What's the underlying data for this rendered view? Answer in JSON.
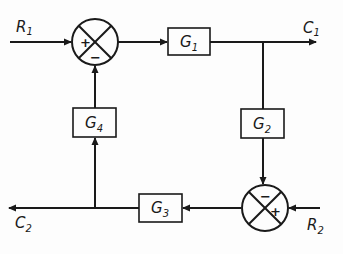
{
  "diagram": {
    "type": "block-diagram",
    "colors": {
      "stroke": "#1a1a1a",
      "background": "#fdfdfd"
    },
    "inputs": [
      {
        "id": "R1",
        "base": "R",
        "sub": "1"
      },
      {
        "id": "R2",
        "base": "R",
        "sub": "2"
      }
    ],
    "outputs": [
      {
        "id": "C1",
        "base": "C",
        "sub": "1"
      },
      {
        "id": "C2",
        "base": "C",
        "sub": "2"
      }
    ],
    "blocks": [
      {
        "id": "G1",
        "base": "G",
        "sub": "1"
      },
      {
        "id": "G2",
        "base": "G",
        "sub": "2"
      },
      {
        "id": "G3",
        "base": "G",
        "sub": "3"
      },
      {
        "id": "G4",
        "base": "G",
        "sub": "4"
      }
    ],
    "summing_junctions": [
      {
        "id": "S1",
        "signs": {
          "left": "+",
          "bottom": "−"
        }
      },
      {
        "id": "S2",
        "signs": {
          "top": "−",
          "right": "+"
        }
      }
    ],
    "connections": [
      {
        "from": "R1",
        "to": "S1",
        "sign": "+"
      },
      {
        "from": "S1",
        "to": "G1"
      },
      {
        "from": "G1",
        "to": "C1"
      },
      {
        "from": "G1",
        "to": "G2"
      },
      {
        "from": "G2",
        "to": "S2",
        "sign": "−"
      },
      {
        "from": "R2",
        "to": "S2",
        "sign": "+"
      },
      {
        "from": "S2",
        "to": "G3"
      },
      {
        "from": "G3",
        "to": "C2"
      },
      {
        "from": "G3",
        "to": "G4"
      },
      {
        "from": "G4",
        "to": "S1",
        "sign": "−"
      }
    ]
  }
}
